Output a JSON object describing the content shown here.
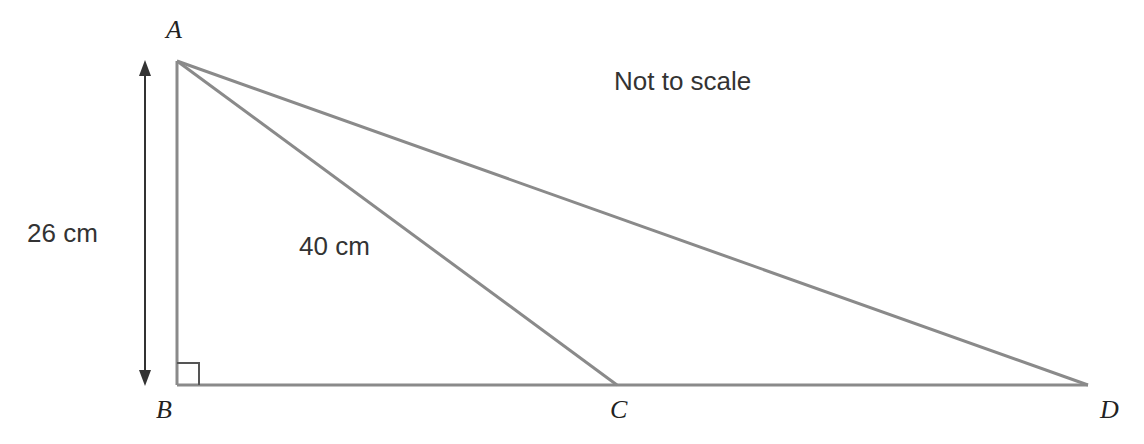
{
  "diagram": {
    "note": "Not to scale",
    "vertices": {
      "A": {
        "label": "A",
        "x": 177,
        "y": 61
      },
      "B": {
        "label": "B",
        "x": 177,
        "y": 385
      },
      "C": {
        "label": "C",
        "x": 617,
        "y": 385
      },
      "D": {
        "label": "D",
        "x": 1088,
        "y": 385
      }
    },
    "measurements": {
      "AB": "26 cm",
      "AC": "40 cm"
    },
    "right_angle_at": "B",
    "colors": {
      "line": "#8a8a8a",
      "arrow": "#333333",
      "text": "#222222"
    }
  }
}
